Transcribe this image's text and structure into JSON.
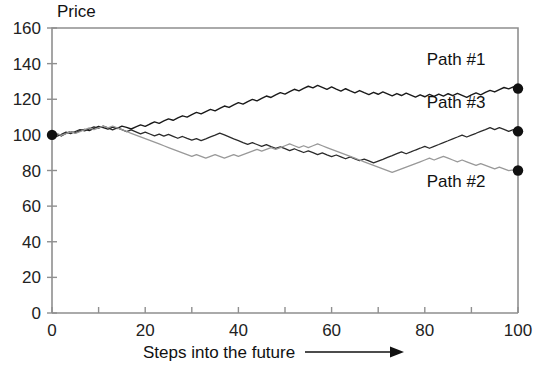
{
  "chart_data": {
    "type": "line",
    "title": "",
    "ylabel": "Price",
    "xlabel": "Steps into the future",
    "xlabel_arrow": "→",
    "xlim": [
      0,
      100
    ],
    "ylim": [
      0,
      160
    ],
    "yticks": [
      0,
      20,
      40,
      60,
      80,
      100,
      120,
      140,
      160
    ],
    "xticks": [
      0,
      20,
      40,
      60,
      80,
      100
    ],
    "xtick_minor_step": 10,
    "grid": false,
    "legend_position": "inline-right",
    "endpoint_markers": true,
    "annotations": [
      {
        "text": "Path #1",
        "x": 93,
        "y": 139
      },
      {
        "text": "Path #3",
        "x": 93,
        "y": 115
      },
      {
        "text": "Path #2",
        "x": 93,
        "y": 71
      }
    ],
    "series": [
      {
        "name": "Path #1",
        "color": "#1a1a1a",
        "width": 1.4,
        "end_value": 126,
        "values": [
          100.0,
          100.6,
          99.4,
          100.9,
          101.8,
          101.1,
          102.3,
          103.1,
          102.4,
          103.6,
          104.7,
          104.1,
          103.2,
          104.4,
          103.6,
          104.9,
          104.2,
          103.3,
          104.5,
          105.6,
          104.8,
          106.1,
          107.3,
          106.5,
          107.8,
          109.0,
          108.2,
          109.5,
          110.7,
          110.0,
          111.4,
          112.6,
          111.8,
          113.1,
          114.3,
          113.5,
          114.9,
          116.2,
          115.4,
          116.8,
          118.1,
          117.3,
          118.7,
          119.9,
          119.1,
          120.5,
          121.8,
          121.0,
          122.4,
          123.7,
          122.9,
          124.3,
          125.6,
          124.7,
          126.1,
          127.3,
          126.4,
          127.8,
          126.7,
          125.6,
          126.9,
          125.7,
          124.6,
          125.9,
          124.7,
          123.6,
          124.9,
          123.7,
          122.6,
          123.9,
          122.8,
          124.1,
          123.0,
          121.9,
          123.2,
          122.1,
          123.4,
          122.3,
          121.2,
          122.5,
          121.4,
          122.7,
          121.6,
          122.9,
          121.8,
          123.1,
          122.0,
          123.3,
          122.2,
          121.1,
          122.4,
          123.6,
          122.5,
          123.8,
          125.0,
          124.1,
          125.4,
          126.6,
          125.8,
          127.0,
          126.0
        ]
      },
      {
        "name": "Path #3",
        "color": "#2b2b2b",
        "width": 1.3,
        "end_value": 102,
        "values": [
          100.0,
          99.2,
          100.3,
          101.5,
          100.7,
          101.9,
          103.0,
          102.2,
          103.4,
          104.5,
          103.7,
          104.9,
          103.9,
          102.8,
          103.9,
          102.9,
          101.8,
          102.8,
          101.7,
          100.6,
          101.6,
          100.5,
          99.4,
          100.4,
          99.3,
          100.3,
          99.2,
          98.1,
          99.1,
          98.0,
          97.0,
          97.9,
          96.8,
          97.8,
          98.9,
          99.9,
          101.0,
          100.0,
          98.9,
          97.8,
          96.8,
          95.7,
          94.7,
          95.6,
          94.6,
          93.5,
          94.5,
          93.4,
          92.4,
          93.3,
          92.3,
          91.2,
          92.2,
          91.1,
          90.1,
          91.0,
          90.0,
          88.9,
          89.9,
          88.8,
          87.8,
          88.7,
          87.7,
          86.6,
          87.6,
          86.5,
          85.5,
          86.4,
          85.4,
          84.3,
          85.3,
          86.3,
          87.4,
          88.4,
          89.5,
          90.5,
          89.4,
          90.4,
          91.5,
          92.5,
          93.6,
          92.5,
          93.6,
          94.6,
          95.7,
          96.7,
          97.8,
          98.8,
          99.9,
          98.8,
          99.9,
          100.9,
          102.0,
          103.0,
          104.1,
          103.0,
          104.1,
          103.1,
          102.0,
          103.0,
          102.0
        ]
      },
      {
        "name": "Path #2",
        "color": "#999999",
        "width": 1.3,
        "end_value": 80,
        "values": [
          100.0,
          100.8,
          99.7,
          100.7,
          101.8,
          100.8,
          101.8,
          102.9,
          103.9,
          102.9,
          103.9,
          104.9,
          103.9,
          104.9,
          103.9,
          102.9,
          101.9,
          100.9,
          99.9,
          98.9,
          97.9,
          96.9,
          95.9,
          94.9,
          93.9,
          92.9,
          91.9,
          90.9,
          89.9,
          88.9,
          87.9,
          88.9,
          87.9,
          86.9,
          87.9,
          88.9,
          87.9,
          86.9,
          87.9,
          88.9,
          87.9,
          88.9,
          89.9,
          90.9,
          91.9,
          90.9,
          91.9,
          92.9,
          91.9,
          92.9,
          93.9,
          94.9,
          93.9,
          92.9,
          93.9,
          92.9,
          93.9,
          94.9,
          93.9,
          92.9,
          91.9,
          90.9,
          89.9,
          88.9,
          87.9,
          86.9,
          85.9,
          84.9,
          83.9,
          82.9,
          81.9,
          80.9,
          79.9,
          78.9,
          79.9,
          80.9,
          81.9,
          82.9,
          83.9,
          84.9,
          85.9,
          86.9,
          85.9,
          86.9,
          87.9,
          86.9,
          85.9,
          84.9,
          85.9,
          84.9,
          83.9,
          82.9,
          83.9,
          82.9,
          81.9,
          80.9,
          81.9,
          80.9,
          79.9,
          80.4,
          80.0
        ]
      }
    ]
  },
  "figure": {
    "plot_left_px": 52,
    "plot_right_px": 518,
    "plot_top_px": 28,
    "plot_bottom_px": 313
  }
}
